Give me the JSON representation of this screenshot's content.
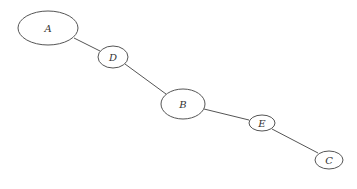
{
  "diagram": {
    "type": "tree-graph",
    "nodes": [
      {
        "id": "A",
        "label": "A",
        "cx": 48,
        "cy": 28,
        "rx": 30,
        "ry": 17
      },
      {
        "id": "D",
        "label": "D",
        "cx": 113,
        "cy": 57,
        "rx": 15,
        "ry": 11
      },
      {
        "id": "B",
        "label": "B",
        "cx": 183,
        "cy": 104,
        "rx": 22,
        "ry": 15
      },
      {
        "id": "E",
        "label": "E",
        "cx": 262,
        "cy": 123,
        "rx": 13,
        "ry": 8
      },
      {
        "id": "C",
        "label": "C",
        "cx": 329,
        "cy": 160,
        "rx": 14,
        "ry": 9
      }
    ],
    "edges": [
      {
        "from": "A",
        "to": "D"
      },
      {
        "from": "D",
        "to": "B"
      },
      {
        "from": "B",
        "to": "E"
      },
      {
        "from": "E",
        "to": "C"
      }
    ]
  }
}
